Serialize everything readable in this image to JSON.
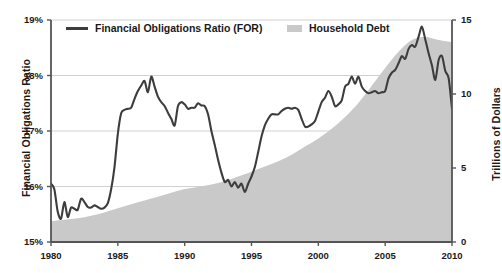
{
  "chart_data": {
    "type": "line",
    "title": "",
    "xlabel": "",
    "ylabel": "Financial Obligations Ratio",
    "ylabel_right": "Trillions of Dollars",
    "xlim": [
      1980,
      2010
    ],
    "ylim": [
      15,
      19
    ],
    "ylim_right": [
      0,
      15
    ],
    "grid": true,
    "legend_position": "top-left",
    "xticks": [
      "1980",
      "1985",
      "1990",
      "1995",
      "2000",
      "2005",
      "2010"
    ],
    "xtick_values": [
      1980,
      1985,
      1990,
      1995,
      2000,
      2005,
      2010
    ],
    "yticks_left": [
      "15%",
      "16%",
      "17%",
      "18%",
      "19%"
    ],
    "ytick_values_left": [
      15,
      16,
      17,
      18,
      19
    ],
    "yticks_right": [
      "0",
      "5",
      "10",
      "15"
    ],
    "ytick_values_right": [
      0,
      5,
      10,
      15
    ],
    "colors": {
      "line": "#3d3d3d",
      "area": "#c9c9c9",
      "axis": "#555555",
      "grid": "#d0d0d0",
      "text": "#1a1a1a"
    },
    "series": [
      {
        "name": "Financial Obligations Ratio (FOR)",
        "type": "line",
        "axis": "left",
        "units": "percent",
        "color": "#3d3d3d",
        "x": [
          1980.0,
          1980.25,
          1980.5,
          1980.75,
          1981.0,
          1981.25,
          1981.5,
          1981.75,
          1982.0,
          1982.25,
          1982.5,
          1982.75,
          1983.0,
          1983.25,
          1983.5,
          1983.75,
          1984.0,
          1984.25,
          1984.5,
          1984.75,
          1985.0,
          1985.25,
          1985.5,
          1985.75,
          1986.0,
          1986.25,
          1986.5,
          1986.75,
          1987.0,
          1987.25,
          1987.5,
          1987.75,
          1988.0,
          1988.25,
          1988.5,
          1988.75,
          1989.0,
          1989.25,
          1989.5,
          1989.75,
          1990.0,
          1990.25,
          1990.5,
          1990.75,
          1991.0,
          1991.25,
          1991.5,
          1991.75,
          1992.0,
          1992.25,
          1992.5,
          1992.75,
          1993.0,
          1993.25,
          1993.5,
          1993.75,
          1994.0,
          1994.25,
          1994.5,
          1994.75,
          1995.0,
          1995.25,
          1995.5,
          1995.75,
          1996.0,
          1996.25,
          1996.5,
          1996.75,
          1997.0,
          1997.25,
          1997.5,
          1997.75,
          1998.0,
          1998.25,
          1998.5,
          1998.75,
          1999.0,
          1999.25,
          1999.5,
          1999.75,
          2000.0,
          2000.25,
          2000.5,
          2000.75,
          2001.0,
          2001.25,
          2001.5,
          2001.75,
          2002.0,
          2002.25,
          2002.5,
          2002.75,
          2003.0,
          2003.25,
          2003.5,
          2003.75,
          2004.0,
          2004.25,
          2004.5,
          2004.75,
          2005.0,
          2005.25,
          2005.5,
          2005.75,
          2006.0,
          2006.25,
          2006.5,
          2006.75,
          2007.0,
          2007.25,
          2007.5,
          2007.75,
          2008.0,
          2008.25,
          2008.5,
          2008.75,
          2009.0,
          2009.25,
          2009.5,
          2009.75,
          2010.0
        ],
        "values": [
          16.05,
          15.95,
          15.55,
          15.42,
          15.72,
          15.45,
          15.62,
          15.6,
          15.58,
          15.78,
          15.72,
          15.63,
          15.62,
          15.66,
          15.63,
          15.6,
          15.62,
          15.7,
          15.95,
          16.35,
          16.95,
          17.32,
          17.38,
          17.4,
          17.42,
          17.58,
          17.72,
          17.82,
          17.9,
          17.7,
          17.98,
          17.8,
          17.62,
          17.52,
          17.45,
          17.33,
          17.22,
          17.1,
          17.45,
          17.52,
          17.48,
          17.4,
          17.42,
          17.42,
          17.5,
          17.46,
          17.45,
          17.3,
          17.0,
          16.75,
          16.48,
          16.25,
          16.08,
          16.12,
          16.0,
          16.08,
          15.98,
          16.05,
          15.9,
          16.05,
          16.18,
          16.35,
          16.62,
          16.9,
          17.1,
          17.22,
          17.3,
          17.3,
          17.3,
          17.36,
          17.4,
          17.42,
          17.4,
          17.42,
          17.38,
          17.22,
          17.08,
          17.08,
          17.12,
          17.18,
          17.35,
          17.52,
          17.6,
          17.72,
          17.62,
          17.45,
          17.48,
          17.55,
          17.8,
          17.85,
          17.98,
          17.85,
          17.98,
          17.8,
          17.72,
          17.68,
          17.7,
          17.72,
          17.68,
          17.7,
          17.72,
          17.95,
          18.05,
          18.1,
          18.22,
          18.35,
          18.3,
          18.48,
          18.55,
          18.52,
          18.7,
          18.88,
          18.65,
          18.4,
          18.18,
          17.92,
          18.28,
          18.35,
          18.08,
          17.95,
          17.4
        ]
      },
      {
        "name": "Household Debt",
        "type": "area",
        "axis": "right",
        "units": "trillions of dollars",
        "color": "#c9c9c9",
        "x": [
          1980,
          1981,
          1982,
          1983,
          1984,
          1985,
          1986,
          1987,
          1988,
          1989,
          1990,
          1991,
          1992,
          1993,
          1994,
          1995,
          1996,
          1997,
          1998,
          1999,
          2000,
          2001,
          2002,
          2003,
          2004,
          2005,
          2006,
          2007,
          2008,
          2009,
          2010
        ],
        "values": [
          1.4,
          1.5,
          1.6,
          1.78,
          2.0,
          2.28,
          2.55,
          2.8,
          3.05,
          3.32,
          3.58,
          3.72,
          3.88,
          4.1,
          4.42,
          4.75,
          5.1,
          5.45,
          5.9,
          6.45,
          7.0,
          7.65,
          8.45,
          9.4,
          10.55,
          11.75,
          12.85,
          13.65,
          13.85,
          13.65,
          13.5
        ]
      }
    ]
  },
  "legend": {
    "items": [
      {
        "label": "Financial Obligations Ratio (FOR)",
        "marker": "line"
      },
      {
        "label": "Household Debt",
        "marker": "area"
      }
    ]
  }
}
